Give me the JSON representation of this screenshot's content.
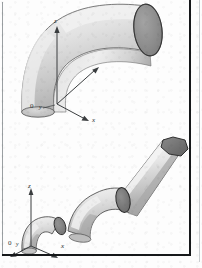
{
  "figure": {
    "background_color": "#fdfdfd",
    "frame_color": "#16181a",
    "panels": [
      {
        "id": "upper",
        "name": "single-elbow-view",
        "description": "Single 90 degree pipe elbow shown in isometric projection with open circular end face",
        "axes": {
          "origin_label": "0",
          "x_label": "x",
          "y_label": "y",
          "z_label": "z"
        },
        "shading": {
          "highlight": "#f1f1f1",
          "body_light": "#dcdcdc",
          "body_mid": "#c4c4c4",
          "body_dark": "#a8a8a8",
          "end_face": "#8f8f8f",
          "outline": "#4a4a4a"
        }
      },
      {
        "id": "lower",
        "name": "articulated-pipe-chain-view",
        "description": "Chain of three pipe elbow segments forming an articulated duct, shown in isometric projection",
        "axes": {
          "origin_label": "0",
          "x_label": "x",
          "y_label": "y",
          "z_label": "z"
        },
        "segments": [
          {
            "name": "segment-1-small-elbow",
            "end_face_color": "#7e7e7e"
          },
          {
            "name": "segment-2-middle-elbow",
            "end_face_color": "#7a7a7a"
          },
          {
            "name": "segment-3-long-duct",
            "end_face_color": "#6f6f6f"
          }
        ],
        "shading": {
          "highlight": "#f2f2f2",
          "body_light": "#dedede",
          "body_mid": "#c6c6c6",
          "body_dark": "#a5a5a5",
          "end_face": "#7c7c7c",
          "outline": "#3f3f3f"
        }
      }
    ]
  }
}
